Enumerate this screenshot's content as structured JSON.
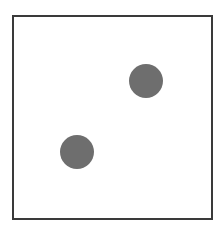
{
  "figure": {
    "frame": {
      "border_color": "#3a3a3a",
      "background": "#ffffff"
    },
    "dots": [
      {
        "cx": 146,
        "cy": 81,
        "r": 17,
        "color": "#6e6e6e"
      },
      {
        "cx": 77,
        "cy": 152,
        "r": 17,
        "color": "#6e6e6e"
      }
    ]
  }
}
